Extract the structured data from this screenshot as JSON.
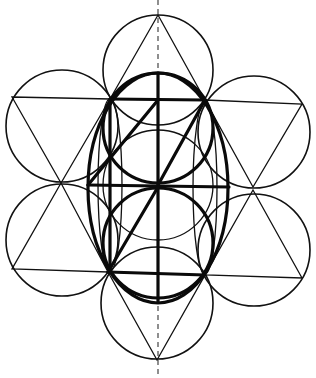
{
  "diagram": {
    "colors": {
      "ink": "#111111",
      "background": "#ffffff"
    },
    "axis": {
      "x": 158,
      "y1": 0,
      "y2": 378
    },
    "outer_circles": [
      {
        "name": "top",
        "cx": 158,
        "cy": 70,
        "r": 55
      },
      {
        "name": "upper-left",
        "cx": 62,
        "cy": 126,
        "r": 56
      },
      {
        "name": "upper-right",
        "cx": 254,
        "cy": 132,
        "r": 56
      },
      {
        "name": "lower-left",
        "cx": 62,
        "cy": 240,
        "r": 56
      },
      {
        "name": "lower-right",
        "cx": 254,
        "cy": 250,
        "r": 56
      },
      {
        "name": "bottom",
        "cx": 157,
        "cy": 303,
        "r": 56
      }
    ],
    "triangles": [
      {
        "name": "top",
        "points": "158,15 110,99 205,100"
      },
      {
        "name": "upper-left",
        "points": "12,97 110,99 61,183"
      },
      {
        "name": "upper-right",
        "points": "205,100 302,104 253,187"
      },
      {
        "name": "lower-left",
        "points": "61,183 12,269 108,272"
      },
      {
        "name": "lower-right",
        "points": "253,190 205,275 302,278"
      },
      {
        "name": "bottom",
        "points": "108,272 205,275 157,360"
      }
    ],
    "central_circles": [
      {
        "name": "upper-bold",
        "cx": 158,
        "cy": 128,
        "r": 55
      },
      {
        "name": "lower-bold",
        "cx": 158,
        "cy": 243,
        "r": 55
      }
    ],
    "inner_thin_circles": [
      {
        "name": "middle-thin",
        "cx": 158,
        "cy": 185,
        "r": 55
      }
    ],
    "side_ellipses": [
      {
        "name": "left-thin",
        "cx": 110,
        "cy": 185,
        "rx": 12,
        "ry": 86
      },
      {
        "name": "right-thin",
        "cx": 205,
        "cy": 188,
        "rx": 12,
        "ry": 86
      }
    ],
    "bold_ellipse": {
      "cx": 158,
      "cy": 188,
      "rx": 70,
      "ry": 115
    },
    "bold_lines": [
      {
        "name": "top-horizontal",
        "x1": 110,
        "y1": 99,
        "x2": 205,
        "y2": 100
      },
      {
        "name": "middle-horizontal",
        "x1": 88,
        "y1": 185,
        "x2": 229,
        "y2": 187
      },
      {
        "name": "bottom-horizontal",
        "x1": 108,
        "y1": 272,
        "x2": 205,
        "y2": 275
      },
      {
        "name": "center-vertical",
        "x1": 158,
        "y1": 73,
        "x2": 158,
        "y2": 302
      },
      {
        "name": "left-vertical",
        "x1": 110,
        "y1": 99,
        "x2": 110,
        "y2": 272
      },
      {
        "name": "diagonal-upper-left",
        "x1": 88,
        "y1": 185,
        "x2": 158,
        "y2": 100
      },
      {
        "name": "diagonal-upper-right",
        "x1": 158,
        "y1": 185,
        "x2": 205,
        "y2": 100
      },
      {
        "name": "diagonal-lower",
        "x1": 108,
        "y1": 272,
        "x2": 158,
        "y2": 187
      }
    ]
  }
}
